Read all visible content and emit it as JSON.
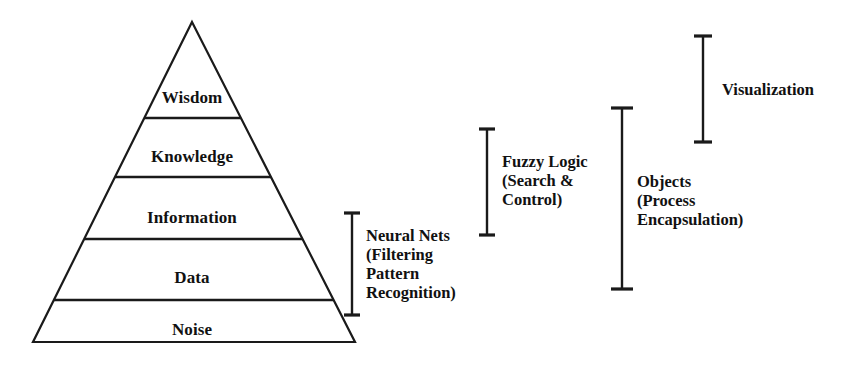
{
  "diagram": {
    "colors": {
      "stroke": "#1a1a1a",
      "background": "#ffffff",
      "text": "#111111"
    },
    "pyramid": {
      "apex": {
        "x": 192,
        "y": 22
      },
      "base_left": {
        "x": 33,
        "y": 342
      },
      "base_right": {
        "x": 355,
        "y": 342
      },
      "tiers": [
        {
          "name": "wisdom",
          "label": "Wisdom",
          "label_x": 192,
          "label_y": 88,
          "divider_y": 118
        },
        {
          "name": "knowledge",
          "label": "Knowledge",
          "label_x": 192,
          "label_y": 147,
          "divider_y": 177
        },
        {
          "name": "information",
          "label": "Information",
          "label_x": 192,
          "label_y": 208,
          "divider_y": 239
        },
        {
          "name": "data",
          "label": "Data",
          "label_x": 192,
          "label_y": 268,
          "divider_y": 300
        },
        {
          "name": "noise",
          "label": "Noise",
          "label_x": 192,
          "label_y": 320,
          "divider_y": null
        }
      ]
    },
    "annotations": [
      {
        "name": "neural-nets",
        "lines": [
          "Neural Nets",
          "(Filtering",
          "Pattern",
          "Recognition)"
        ],
        "text": "Neural Nets\n(Filtering\nPattern\nRecognition)",
        "text_x": 366,
        "text_y": 226,
        "bracket": {
          "x": 352,
          "y_top": 213,
          "y_bottom": 315,
          "cap_half_width": 8
        }
      },
      {
        "name": "fuzzy-logic",
        "lines": [
          "Fuzzy Logic",
          "(Search &",
          "Control)"
        ],
        "text": "Fuzzy Logic\n(Search &\nControl)",
        "text_x": 502,
        "text_y": 152,
        "bracket": {
          "x": 487,
          "y_top": 129,
          "y_bottom": 235,
          "cap_half_width": 8
        }
      },
      {
        "name": "objects",
        "lines": [
          "Objects",
          "(Process",
          "Encapsulation)"
        ],
        "text": "Objects\n(Process\nEncapsulation)",
        "text_x": 637,
        "text_y": 172,
        "bracket": {
          "x": 622,
          "y_top": 108,
          "y_bottom": 289,
          "cap_half_width": 11
        }
      },
      {
        "name": "visualization",
        "lines": [
          "Visualization"
        ],
        "text": "Visualization",
        "text_x": 722,
        "text_y": 80,
        "bracket": {
          "x": 703,
          "y_top": 36,
          "y_bottom": 142,
          "cap_half_width": 9
        }
      }
    ]
  }
}
